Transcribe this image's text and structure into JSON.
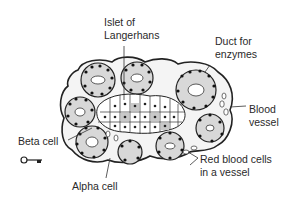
{
  "diagram": {
    "labels": {
      "islet": "Islet of\nLangerhans",
      "duct": "Duct for\nenzymes",
      "blood_vessel": "Blood\nvessel",
      "beta_cell": "Beta cell",
      "alpha_cell": "Alpha cell",
      "red_blood_cells": "Red blood cells\nin a vessel"
    },
    "key_icon": "key-icon"
  }
}
